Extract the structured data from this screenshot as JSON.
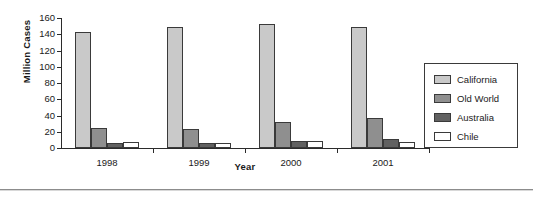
{
  "chart_data": {
    "type": "bar",
    "title": "",
    "xlabel": "Year",
    "ylabel": "Million Cases",
    "categories": [
      "1998",
      "1999",
      "2000",
      "2001"
    ],
    "series": [
      {
        "name": "California",
        "values": [
          143,
          149,
          153,
          149
        ],
        "color": "#c9c9c9"
      },
      {
        "name": "Old World",
        "values": [
          25,
          24,
          32,
          37
        ],
        "color": "#8f8f8f"
      },
      {
        "name": "Australia",
        "values": [
          6,
          6,
          9,
          11
        ],
        "color": "#616161"
      },
      {
        "name": "Chile",
        "values": [
          8,
          6,
          9,
          8
        ],
        "color": "#ffffff"
      }
    ],
    "ylim": [
      0,
      160
    ],
    "ytick_labels": [
      "0",
      "20",
      "40",
      "60",
      "80",
      "100",
      "120",
      "140",
      "160"
    ],
    "ytick_values": [
      0,
      20,
      40,
      60,
      80,
      100,
      120,
      140,
      160
    ],
    "grid": false,
    "legend_position": "right",
    "legend_entries": [
      "California",
      "Old World",
      "Australia",
      "Chile"
    ]
  },
  "axis": {
    "y_title": "Million Cases",
    "x_title": "Year"
  }
}
